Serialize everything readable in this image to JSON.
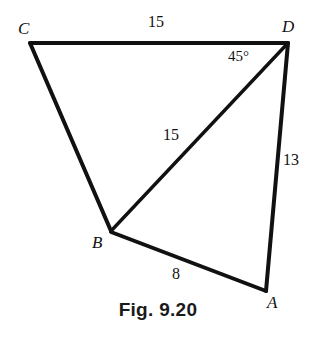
{
  "figure": {
    "caption": "Fig. 9.20",
    "stroke_color": "#111111",
    "background_color": "#ffffff",
    "vertices": [
      {
        "name": "C",
        "label": "C",
        "x": 30,
        "y": 43
      },
      {
        "name": "D",
        "label": "D",
        "x": 288,
        "y": 43
      },
      {
        "name": "B",
        "label": "B",
        "x": 111,
        "y": 231
      },
      {
        "name": "A",
        "label": "A",
        "x": 266,
        "y": 291
      }
    ],
    "edges": [
      {
        "name": "edge-CD",
        "from": "C",
        "to": "D",
        "measure": "15"
      },
      {
        "name": "edge-CB",
        "from": "C",
        "to": "B",
        "measure": ""
      },
      {
        "name": "edge-BD",
        "from": "B",
        "to": "D",
        "measure": "15"
      },
      {
        "name": "edge-DA",
        "from": "D",
        "to": "A",
        "measure": "13"
      },
      {
        "name": "edge-BA",
        "from": "B",
        "to": "A",
        "measure": "8"
      }
    ],
    "labels": {
      "cd_length": "15",
      "bd_length": "15",
      "da_length": "13",
      "ba_length": "8",
      "angle_bda": "45°"
    }
  }
}
